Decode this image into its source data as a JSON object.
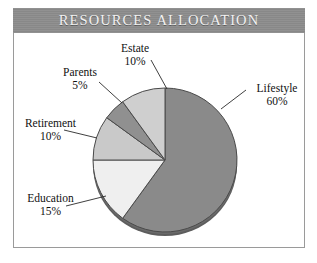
{
  "chart_frame": {
    "border_color": "#9a9a9a",
    "background": "#ffffff"
  },
  "title": {
    "text": "RESOURCES ALLOCATION",
    "background_color": "#8d8d8d",
    "text_color": "#f2f2f2"
  },
  "chart_data": {
    "type": "pie",
    "title": "RESOURCES ALLOCATION",
    "xlabel": "",
    "ylabel": "",
    "legend_position": "none",
    "labels_on_slices": false,
    "start_angle_deg": 0,
    "direction": "clockwise",
    "categories": [
      "Lifestyle",
      "Education",
      "Retirement",
      "Parents",
      "Estate"
    ],
    "values": [
      60,
      15,
      10,
      5,
      10
    ],
    "value_unit": "%",
    "colors": [
      "#8a8a8a",
      "#efefef",
      "#c9c9c9",
      "#909090",
      "#cfcfcf"
    ],
    "slice_edge_color": "#4a4a4a",
    "slices": [
      {
        "name": "Lifestyle",
        "value": 60,
        "label": "Lifestyle",
        "percent_text": "60%",
        "color": "#8a8a8a"
      },
      {
        "name": "Education",
        "value": 15,
        "label": "Education",
        "percent_text": "15%",
        "color": "#efefef"
      },
      {
        "name": "Retirement",
        "value": 10,
        "label": "Retirement",
        "percent_text": "10%",
        "color": "#c9c9c9"
      },
      {
        "name": "Parents",
        "value": 5,
        "label": "Parents",
        "percent_text": "5%",
        "color": "#909090"
      },
      {
        "name": "Estate",
        "value": 10,
        "label": "Estate",
        "percent_text": "10%",
        "color": "#cfcfcf"
      }
    ]
  },
  "labels": {
    "estate": {
      "name": "Estate",
      "percent": "10%"
    },
    "parents": {
      "name": "Parents",
      "percent": "5%"
    },
    "retirement": {
      "name": "Retirement",
      "percent": "10%"
    },
    "education": {
      "name": "Education",
      "percent": "15%"
    },
    "lifestyle": {
      "name": "Lifestyle",
      "percent": "60%"
    }
  }
}
